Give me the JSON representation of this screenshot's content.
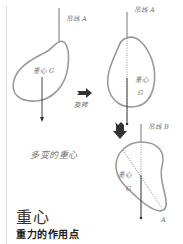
{
  "figure1": {
    "string_label": "吊线 A",
    "cog_label": "重心 G"
  },
  "rotate_label": "旋转",
  "figure2": {
    "string_label": "吊线 A",
    "cog_label": "重心",
    "cog_letter": "G"
  },
  "figure3": {
    "string_label": "吊线 B",
    "cog_label": "重心",
    "cog_letter": "G",
    "point_label": "A"
  },
  "caption": "多变的重心",
  "title": "重心",
  "subtitle": "重力的作用点",
  "colors": {
    "outline": "#9a9a9a",
    "line": "#444444",
    "arrow": "#3a3a3a"
  }
}
